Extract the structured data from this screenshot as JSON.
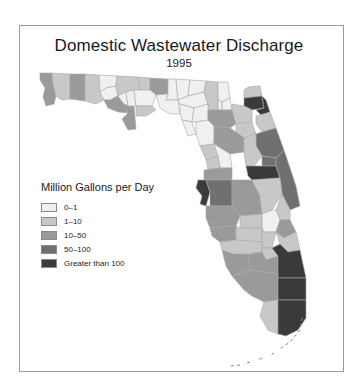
{
  "map": {
    "title": "Domestic Wastewater Discharge",
    "subtitle": "1995",
    "legend": {
      "title": "Million Gallons per Day",
      "items": [
        {
          "label": "0–1",
          "color": "#f0f0f0"
        },
        {
          "label": "1–10",
          "color": "#c8c8c8"
        },
        {
          "label": "10–50",
          "color": "#9a9a9a"
        },
        {
          "label": "50–100",
          "color": "#707070"
        },
        {
          "label": "Greater than 100",
          "color": "#3a3a3a"
        }
      ]
    },
    "counties": [
      {
        "name": "escambia",
        "class": 2,
        "d": "M40,73 L52,73 L53,84 L56,96 L54,104 L46,106 L43,97 L45,88 L40,80 Z"
      },
      {
        "name": "santa-rosa",
        "class": 1,
        "d": "M52,73 L70,74 L70,99 L62,100 L56,96 L53,84 Z"
      },
      {
        "name": "okaloosa",
        "class": 2,
        "d": "M70,74 L85,74 L85,101 L70,99 Z"
      },
      {
        "name": "walton",
        "class": 1,
        "d": "M85,74 L99,75 L100,92 L104,100 L96,104 L85,101 Z"
      },
      {
        "name": "holmes",
        "class": 0,
        "d": "M99,75 L117,76 L116,86 L106,88 L100,92 Z"
      },
      {
        "name": "washington",
        "class": 0,
        "d": "M100,92 L106,88 L116,86 L118,96 L110,100 L104,100 Z"
      },
      {
        "name": "jackson",
        "class": 1,
        "d": "M117,76 L138,77 L140,90 L126,92 L118,96 L116,86 Z"
      },
      {
        "name": "bay",
        "class": 2,
        "d": "M104,100 L110,100 L118,96 L124,104 L128,113 L118,112 L108,108 Z"
      },
      {
        "name": "calhoun",
        "class": 0,
        "d": "M118,96 L126,92 L128,106 L124,104 Z"
      },
      {
        "name": "gulf",
        "class": 2,
        "d": "M124,104 L128,106 L134,106 L136,129 L128,130 L122,119 L128,113 Z"
      },
      {
        "name": "liberty",
        "class": 0,
        "d": "M126,92 L134,90 L136,106 L128,106 Z"
      },
      {
        "name": "gadsden",
        "class": 1,
        "d": "M138,77 L150,78 L150,90 L140,90 Z"
      },
      {
        "name": "leon",
        "class": 2,
        "d": "M150,78 L168,79 L168,94 L156,95 L150,90 Z"
      },
      {
        "name": "wakulla",
        "class": 0,
        "d": "M140,90 L150,90 L156,95 L152,106 L136,106 L134,90 Z"
      },
      {
        "name": "franklin",
        "class": 1,
        "d": "M136,106 L152,106 L156,110 L146,116 L136,116 Z"
      },
      {
        "name": "jefferson",
        "class": 0,
        "d": "M168,79 L176,79 L178,100 L166,100 L168,94 Z"
      },
      {
        "name": "taylor",
        "class": 0,
        "d": "M156,95 L168,94 L166,100 L178,100 L180,114 L170,114 L160,108 Z"
      },
      {
        "name": "madison",
        "class": 0,
        "d": "M176,79 L190,80 L188,96 L178,100 Z"
      },
      {
        "name": "hamilton",
        "class": 0,
        "d": "M190,80 L206,81 L204,92 L188,96 Z"
      },
      {
        "name": "suwannee",
        "class": 0,
        "d": "M188,96 L204,92 L208,104 L194,108 L180,104 L178,100 Z"
      },
      {
        "name": "lafayette",
        "class": 0,
        "d": "M180,104 L194,108 L192,122 L182,120 L180,114 Z"
      },
      {
        "name": "dixie",
        "class": 0,
        "d": "M182,120 L192,122 L196,134 L188,136 Z"
      },
      {
        "name": "columbia",
        "class": 1,
        "d": "M206,81 L218,82 L218,110 L208,110 L208,104 L204,92 Z"
      },
      {
        "name": "gilchrist",
        "class": 0,
        "d": "M194,108 L208,104 L208,120 L196,122 L192,122 Z"
      },
      {
        "name": "levy",
        "class": 0,
        "d": "M196,122 L208,120 L214,126 L214,144 L200,146 L196,134 Z"
      },
      {
        "name": "baker",
        "class": 0,
        "d": "M218,82 L228,82 L230,98 L222,102 L218,100 Z"
      },
      {
        "name": "union",
        "class": 0,
        "d": "M218,100 L222,102 L222,110 L218,110 Z"
      },
      {
        "name": "bradford",
        "class": 0,
        "d": "M222,102 L230,98 L232,110 L222,110 Z"
      },
      {
        "name": "alachua",
        "class": 2,
        "d": "M208,110 L232,110 L236,124 L230,128 L214,126 L208,120 Z"
      },
      {
        "name": "nassau",
        "class": 1,
        "d": "M248,87 L260,86 L262,96 L244,98 L244,90 Z"
      },
      {
        "name": "duval",
        "class": 4,
        "d": "M244,98 L262,96 L264,108 L252,110 L244,106 Z"
      },
      {
        "name": "clay",
        "class": 1,
        "d": "M232,104 L244,106 L252,110 L252,122 L236,124 L232,110 Z"
      },
      {
        "name": "st-johns",
        "class": 4,
        "d": "M262,96 L266,100 L270,112 L262,116 L256,110 L264,108 Z"
      },
      {
        "name": "putnam",
        "class": 1,
        "d": "M236,124 L252,122 L256,134 L244,138 L236,132 Z"
      },
      {
        "name": "flagler",
        "class": 1,
        "d": "M256,116 L270,112 L276,128 L262,132 L256,124 Z"
      },
      {
        "name": "marion",
        "class": 2,
        "d": "M214,126 L230,128 L236,132 L244,138 L244,152 L230,154 L214,144 Z"
      },
      {
        "name": "volusia",
        "class": 3,
        "d": "M256,134 L262,132 L276,128 L284,150 L276,158 L262,156 L256,146 Z"
      },
      {
        "name": "lake",
        "class": 1,
        "d": "M244,138 L256,134 L256,146 L262,156 L254,166 L246,166 L244,152 Z"
      },
      {
        "name": "citrus",
        "class": 1,
        "d": "M200,146 L214,144 L218,156 L206,160 Z"
      },
      {
        "name": "sumter",
        "class": 0,
        "d": "M214,144 L230,154 L232,168 L220,168 L218,156 Z"
      },
      {
        "name": "hernando",
        "class": 1,
        "d": "M206,160 L218,156 L220,168 L208,170 Z"
      },
      {
        "name": "seminole",
        "class": 3,
        "d": "M262,156 L276,158 L276,166 L262,166 Z"
      },
      {
        "name": "orange",
        "class": 4,
        "d": "M246,166 L254,166 L262,166 L276,166 L280,178 L252,180 L248,176 Z"
      },
      {
        "name": "brevard",
        "class": 3,
        "d": "M276,158 L284,150 L296,186 L300,206 L290,210 L282,194 L280,178 L276,166 Z"
      },
      {
        "name": "pasco",
        "class": 2,
        "d": "M204,170 L220,168 L232,168 L232,180 L204,180 Z"
      },
      {
        "name": "pinellas",
        "class": 4,
        "d": "M198,180 L206,180 L210,192 L206,206 L200,204 L202,196 L196,188 Z"
      },
      {
        "name": "hillsborough",
        "class": 3,
        "d": "M206,180 L232,180 L232,206 L210,206 L210,192 Z"
      },
      {
        "name": "polk",
        "class": 2,
        "d": "M232,180 L252,180 L260,196 L262,214 L240,216 L232,206 Z"
      },
      {
        "name": "osceola",
        "class": 1,
        "d": "M252,180 L280,178 L282,194 L272,210 L262,214 L260,196 Z"
      },
      {
        "name": "indian-river",
        "class": 1,
        "d": "M282,194 L290,210 L290,220 L280,220 L276,210 Z"
      },
      {
        "name": "manatee",
        "class": 2,
        "d": "M206,206 L232,206 L240,216 L236,226 L210,228 L206,218 Z"
      },
      {
        "name": "hardee",
        "class": 1,
        "d": "M240,216 L262,214 L262,228 L240,228 Z"
      },
      {
        "name": "okeechobee",
        "class": 0,
        "d": "M262,214 L272,210 L276,210 L280,220 L276,232 L264,232 L262,228 Z"
      },
      {
        "name": "st-lucie",
        "class": 2,
        "d": "M280,220 L290,220 L296,232 L284,238 L276,232 Z"
      },
      {
        "name": "sarasota",
        "class": 2,
        "d": "M210,228 L236,226 L236,240 L220,242 L212,236 Z"
      },
      {
        "name": "desoto",
        "class": 1,
        "d": "M236,226 L240,228 L262,228 L262,242 L236,240 Z"
      },
      {
        "name": "highlands",
        "class": 1,
        "d": "M262,228 L264,232 L276,232 L272,248 L262,248 L262,242 Z"
      },
      {
        "name": "martin",
        "class": 1,
        "d": "M276,232 L284,238 L296,232 L300,250 L288,252 L280,244 Z"
      },
      {
        "name": "charlotte",
        "class": 1,
        "d": "M220,242 L236,240 L262,242 L262,252 L232,254 L222,250 Z"
      },
      {
        "name": "glades",
        "class": 1,
        "d": "M262,248 L272,248 L278,256 L266,260 L262,252 Z"
      },
      {
        "name": "lee",
        "class": 2,
        "d": "M222,250 L232,254 L248,254 L250,270 L232,276 L226,266 Z"
      },
      {
        "name": "hendry",
        "class": 2,
        "d": "M248,254 L262,252 L266,260 L278,256 L278,274 L250,270 Z"
      },
      {
        "name": "palm-beach",
        "class": 4,
        "d": "M272,248 L280,244 L288,252 L300,250 L306,278 L278,278 L278,256 Z"
      },
      {
        "name": "collier",
        "class": 2,
        "d": "M232,276 L250,270 L278,274 L278,300 L264,302 L252,296 L244,290 Z"
      },
      {
        "name": "broward",
        "class": 4,
        "d": "M278,278 L306,278 L306,300 L278,300 Z"
      },
      {
        "name": "monroe-mainland",
        "class": 1,
        "d": "M264,302 L278,300 L278,334 L268,330 L260,316 Z"
      },
      {
        "name": "miami-dade",
        "class": 4,
        "d": "M278,300 L306,300 L306,318 L298,330 L286,336 L278,334 Z"
      }
    ],
    "keys": "M302,318 L300,330 L290,342 L278,350 M274,353 L270,356 M262,358 L258,360 M250,362 L244,364 M240,365 L230,366"
  }
}
